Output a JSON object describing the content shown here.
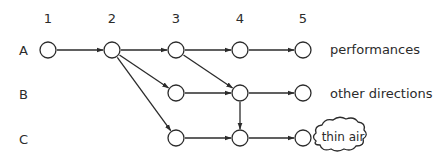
{
  "diagram": {
    "columns": [
      {
        "label": "1",
        "x": 48
      },
      {
        "label": "2",
        "x": 112
      },
      {
        "label": "3",
        "x": 176
      },
      {
        "label": "4",
        "x": 240
      },
      {
        "label": "5",
        "x": 303
      }
    ],
    "rows": [
      {
        "label": "A",
        "y": 50,
        "outcome": "performances"
      },
      {
        "label": "B",
        "y": 93,
        "outcome": "other directions"
      },
      {
        "label": "C",
        "y": 138,
        "outcome": "thin air",
        "outcome_shape": "cloud"
      }
    ],
    "nodes": [
      {
        "id": "A1",
        "row": "A",
        "col": "1"
      },
      {
        "id": "A2",
        "row": "A",
        "col": "2"
      },
      {
        "id": "A3",
        "row": "A",
        "col": "3"
      },
      {
        "id": "A4",
        "row": "A",
        "col": "4"
      },
      {
        "id": "A5",
        "row": "A",
        "col": "5"
      },
      {
        "id": "B3",
        "row": "B",
        "col": "3"
      },
      {
        "id": "B4",
        "row": "B",
        "col": "4"
      },
      {
        "id": "B5",
        "row": "B",
        "col": "5"
      },
      {
        "id": "C3",
        "row": "C",
        "col": "3"
      },
      {
        "id": "C4",
        "row": "C",
        "col": "4"
      },
      {
        "id": "C5",
        "row": "C",
        "col": "5"
      }
    ],
    "edges": [
      [
        "A1",
        "A2"
      ],
      [
        "A2",
        "A3"
      ],
      [
        "A3",
        "A4"
      ],
      [
        "A4",
        "A5"
      ],
      [
        "A2",
        "B3"
      ],
      [
        "A2",
        "C3"
      ],
      [
        "A3",
        "B4"
      ],
      [
        "B3",
        "B4"
      ],
      [
        "B4",
        "B5"
      ],
      [
        "B4",
        "C4"
      ],
      [
        "C3",
        "C4"
      ],
      [
        "C4",
        "C5"
      ]
    ],
    "style": {
      "stroke": "#2b2b2b",
      "node_radius": 8
    }
  }
}
